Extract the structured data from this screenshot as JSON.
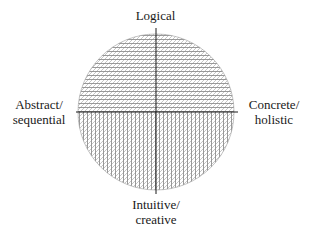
{
  "diagram": {
    "type": "quadrant-circle",
    "axes": {
      "top": {
        "lines": [
          "Logical"
        ]
      },
      "bottom": {
        "lines": [
          "Intuitive/",
          "creative"
        ]
      },
      "left": {
        "lines": [
          "Abstract/",
          "sequential"
        ]
      },
      "right": {
        "lines": [
          "Concrete/",
          "holistic"
        ]
      }
    },
    "regions": [
      {
        "name": "upper-half",
        "pattern": "horizontal + diagonal hatching"
      },
      {
        "name": "lower-half",
        "pattern": "vertical + diagonal hatching"
      }
    ],
    "colors": {
      "line": "#1a1a1a",
      "hatch": "#6e6e6e",
      "background": "#ffffff"
    }
  }
}
